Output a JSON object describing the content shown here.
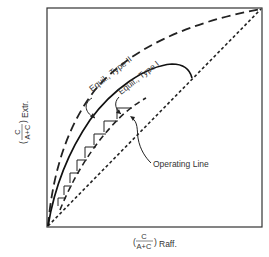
{
  "diagram": {
    "type": "liquid-liquid extraction McCabe-Thiele style diagram",
    "axes": {
      "x_label": {
        "paren_open": "(",
        "numerator": "C",
        "denominator": "A+C",
        "paren_close": ")",
        "suffix": "Raff."
      },
      "y_label": {
        "paren_open": "(",
        "numerator": "C",
        "denominator": "A+C",
        "paren_close": ")",
        "suffix": "Extr."
      }
    },
    "curves": {
      "equil_type_2": {
        "label": "Equil., Type II",
        "style": "long-dash"
      },
      "equil_type_1": {
        "label": "Equil., Type I",
        "style": "solid"
      },
      "operating_line": {
        "label": "Operating Line",
        "style": "dash"
      },
      "diagonal": {
        "label": "",
        "style": "short-dash"
      }
    },
    "stages": {
      "count": 6,
      "marker": "staircase steps between equilibrium Type I and operating line"
    },
    "colors": {
      "ink": "#222222",
      "background": "#ffffff"
    }
  }
}
